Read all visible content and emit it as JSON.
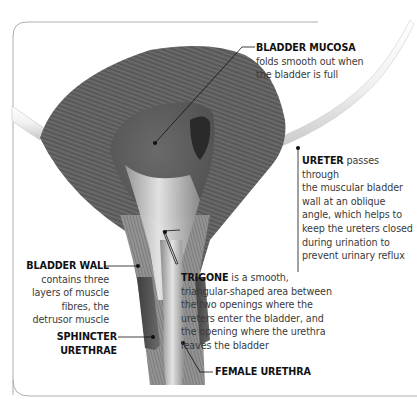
{
  "diagram": {
    "labels": {
      "bladder_mucosa": {
        "title": "BLADDER MUCOSA",
        "lines": [
          "folds smooth out when",
          "the bladder is full"
        ]
      },
      "ureter": {
        "title": "URETER",
        "first_line_rest": " passes through",
        "lines": [
          "the muscular bladder",
          "wall at an oblique",
          "angle, which helps to",
          "keep the ureters closed",
          "during urination to",
          "prevent urinary reflux"
        ]
      },
      "bladder_wall": {
        "title": "BLADDER WALL",
        "lines": [
          "contains three",
          "layers of muscle",
          "fibres, the",
          "detrusor muscle"
        ]
      },
      "trigone": {
        "title": "TRIGONE",
        "first_line_rest": " is a smooth,",
        "lines": [
          "triangular-shaped area between",
          "the two openings where the",
          "ureters enter the bladder, and",
          "the opening where the urethra",
          "leaves the bladder"
        ]
      },
      "sphincter_urethrae": {
        "title": "SPHINCTER URETHRAE"
      },
      "female_urethra": {
        "title": "FEMALE URETHRA"
      }
    },
    "colors": {
      "frame": "#9a9a9a",
      "leader": "#111111",
      "muscle_dark": "#4a4a4a",
      "muscle_mid": "#6e6e6e",
      "mucosa": "#5c5c5c",
      "trigone_light": "#d8d8d8",
      "ureter_tube": "#eeeeee",
      "sphincter": "#555555"
    }
  }
}
